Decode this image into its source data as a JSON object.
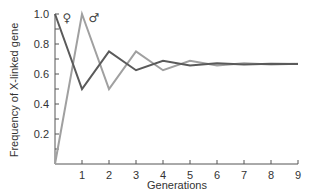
{
  "chart_data": {
    "type": "line",
    "title": "",
    "xlabel": "Generations",
    "ylabel": "Frequency of  X-linked gene",
    "x": [
      0,
      1,
      2,
      3,
      4,
      5,
      6,
      7,
      8,
      9
    ],
    "x_tick_labels": [
      "1",
      "2",
      "3",
      "4",
      "5",
      "6",
      "7",
      "8",
      "9"
    ],
    "y_tick_labels": [
      "0.2",
      "0.4",
      "0.6",
      "0.8",
      "1.0"
    ],
    "xlim": [
      0,
      9
    ],
    "ylim": [
      0,
      1.0
    ],
    "grid": false,
    "series": [
      {
        "name": "♀",
        "color": "#5a5a5a",
        "values": [
          1.0,
          0.5,
          0.75,
          0.625,
          0.688,
          0.656,
          0.672,
          0.664,
          0.668,
          0.666
        ]
      },
      {
        "name": "♂",
        "color": "#a0a0a0",
        "values": [
          0.0,
          1.0,
          0.5,
          0.75,
          0.625,
          0.688,
          0.656,
          0.672,
          0.664,
          0.668
        ]
      }
    ],
    "legend": {
      "position": "top-left inline labels",
      "entries": [
        "♀",
        "♂"
      ]
    }
  }
}
